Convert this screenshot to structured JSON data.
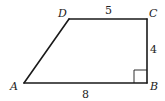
{
  "figure": {
    "type": "trapezoid",
    "vertices": {
      "A": "A",
      "B": "B",
      "C": "C",
      "D": "D"
    },
    "side_lengths": {
      "DC": "5",
      "CB": "4",
      "AB": "8"
    },
    "right_angle_at": "B",
    "colors": {
      "stroke": "#1a1a1a",
      "background": "#ffffff"
    }
  }
}
